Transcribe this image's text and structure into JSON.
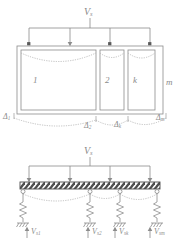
{
  "figure": {
    "type": "structural-mechanics-diagram",
    "stroke_color": "#8c8c8c",
    "dotted_color": "#b0b0b0",
    "hatch_color": "#4d4d4d",
    "background": "#ffffff"
  },
  "top_diagram": {
    "name": "multi-cell-frame",
    "load_label": "V",
    "load_label_sub": "s",
    "arrow_count": 4,
    "cells": [
      {
        "label": "1"
      },
      {
        "label": "2"
      },
      {
        "label": "k"
      }
    ],
    "outer_label": "m",
    "deflection_curves": 3
  },
  "deflection_labels": [
    {
      "symbol": "Δ",
      "sub": "1"
    },
    {
      "symbol": "Δ",
      "sub": "2"
    },
    {
      "symbol": "Δ",
      "sub": "k"
    },
    {
      "symbol": "Δ",
      "sub": "m"
    }
  ],
  "bottom_diagram": {
    "name": "equivalent-spring-model",
    "load_label": "V",
    "load_label_sub": "s",
    "arrow_count": 4,
    "beam": {
      "name": "hatched-rigid-beam",
      "hatched": true
    },
    "supports": 4,
    "springs": 4,
    "grounds": 4,
    "reactions": [
      {
        "symbol": "V",
        "sub": "s1"
      },
      {
        "symbol": "V",
        "sub": "s2"
      },
      {
        "symbol": "V",
        "sub": "sk"
      },
      {
        "symbol": "V",
        "sub": "sm"
      }
    ]
  }
}
